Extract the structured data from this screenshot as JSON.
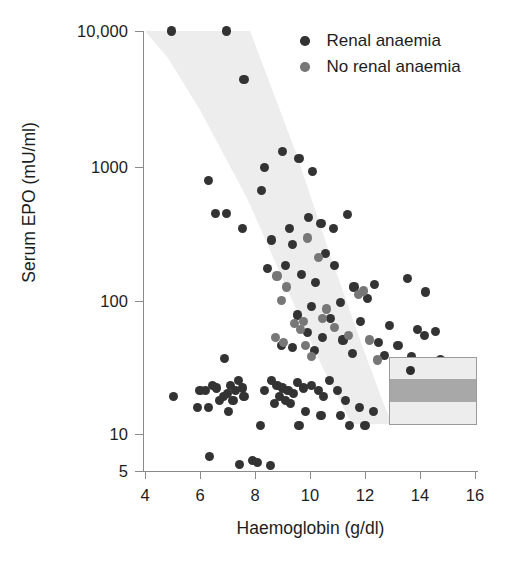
{
  "chart_data": {
    "type": "scatter",
    "title": "",
    "xlabel": "Haemoglobin (g/dl)",
    "ylabel": "Serum EPO (mU/ml)",
    "xlim": [
      4,
      16
    ],
    "ylim": [
      5,
      10000
    ],
    "yscale": "log",
    "xscale": "linear",
    "grid": false,
    "xticks": [
      4,
      6,
      8,
      10,
      12,
      14,
      16
    ],
    "xtick_labels": [
      "4",
      "6",
      "8",
      "10",
      "12",
      "14",
      "16"
    ],
    "yticks": [
      5,
      10,
      100,
      1000,
      10000
    ],
    "ytick_labels": [
      "5",
      "10",
      "100",
      "1000",
      "10,000"
    ],
    "legend_position": "top-right",
    "legend": [
      {
        "name": "Renal anaemia",
        "color": "#333333"
      },
      {
        "name": "No renal anaemia",
        "color": "#777777"
      }
    ],
    "annotations": [
      {
        "name": "reference-band",
        "description": "Shaded grey band showing normal EPO response to haemoglobin",
        "color": "#ededed"
      },
      {
        "name": "inset-box",
        "description": "Inset rectangle with grey reference band at lower right",
        "color": "#ededed",
        "band_color": "#a8a8a8"
      }
    ],
    "series": [
      {
        "name": "Renal anaemia",
        "color": "#333333",
        "points": [
          [
            4.95,
            10000
          ],
          [
            6.95,
            10000
          ],
          [
            7.6,
            4300
          ],
          [
            6.3,
            760
          ],
          [
            6.55,
            430
          ],
          [
            6.95,
            430
          ],
          [
            8.35,
            950
          ],
          [
            8.25,
            640
          ],
          [
            7.55,
            330
          ],
          [
            9.0,
            1250
          ],
          [
            9.6,
            1100
          ],
          [
            10.1,
            880
          ],
          [
            9.25,
            330
          ],
          [
            8.6,
            270
          ],
          [
            9.35,
            250
          ],
          [
            9.95,
            400
          ],
          [
            10.4,
            360
          ],
          [
            10.85,
            330
          ],
          [
            11.35,
            420
          ],
          [
            10.55,
            215
          ],
          [
            9.1,
            175
          ],
          [
            8.45,
            165
          ],
          [
            9.7,
            150
          ],
          [
            10.9,
            175
          ],
          [
            10.2,
            130
          ],
          [
            11.6,
            120
          ],
          [
            12.35,
            125
          ],
          [
            13.55,
            140
          ],
          [
            14.2,
            110
          ],
          [
            12.1,
            98
          ],
          [
            11.1,
            92
          ],
          [
            10.05,
            86
          ],
          [
            9.55,
            74
          ],
          [
            10.75,
            70
          ],
          [
            11.85,
            66
          ],
          [
            12.9,
            62
          ],
          [
            13.9,
            58
          ],
          [
            14.55,
            56
          ],
          [
            14.15,
            52
          ],
          [
            9.9,
            55
          ],
          [
            10.45,
            50
          ],
          [
            11.2,
            48
          ],
          [
            12.5,
            46
          ],
          [
            13.2,
            44
          ],
          [
            8.95,
            44
          ],
          [
            9.35,
            42
          ],
          [
            10.15,
            40
          ],
          [
            11.55,
            38
          ],
          [
            12.7,
            37
          ],
          [
            13.7,
            36
          ],
          [
            14.75,
            34
          ],
          [
            6.9,
            35
          ],
          [
            7.1,
            22
          ],
          [
            6.6,
            21
          ],
          [
            7.3,
            20
          ],
          [
            7.0,
            19
          ],
          [
            6.85,
            18
          ],
          [
            6.45,
            22
          ],
          [
            6.2,
            20
          ],
          [
            6.7,
            17
          ],
          [
            7.2,
            17
          ],
          [
            7.4,
            24
          ],
          [
            7.55,
            21
          ],
          [
            7.6,
            18
          ],
          [
            5.05,
            18
          ],
          [
            6.0,
            20
          ],
          [
            5.9,
            15
          ],
          [
            6.3,
            15
          ],
          [
            7.05,
            14
          ],
          [
            8.6,
            24
          ],
          [
            8.8,
            22
          ],
          [
            9.0,
            21
          ],
          [
            9.2,
            20
          ],
          [
            9.4,
            19
          ],
          [
            8.9,
            18
          ],
          [
            9.1,
            17
          ],
          [
            9.55,
            23
          ],
          [
            9.75,
            21
          ],
          [
            9.3,
            16
          ],
          [
            8.7,
            16
          ],
          [
            8.35,
            20
          ],
          [
            10.05,
            22
          ],
          [
            10.3,
            20
          ],
          [
            10.5,
            18
          ],
          [
            10.7,
            24
          ],
          [
            11.0,
            20
          ],
          [
            11.3,
            17
          ],
          [
            9.85,
            14
          ],
          [
            10.4,
            13
          ],
          [
            11.1,
            13
          ],
          [
            11.8,
            15
          ],
          [
            12.3,
            14
          ],
          [
            12.0,
            11
          ],
          [
            11.45,
            11
          ],
          [
            9.6,
            11
          ],
          [
            8.2,
            11
          ],
          [
            6.35,
            6.4
          ],
          [
            7.45,
            5.6
          ],
          [
            8.1,
            5.8
          ],
          [
            8.55,
            5.5
          ],
          [
            7.9,
            6.0
          ]
        ]
      },
      {
        "name": "No renal anaemia",
        "color": "#777777",
        "points": [
          [
            9.9,
            280
          ],
          [
            8.8,
            145
          ],
          [
            10.3,
            200
          ],
          [
            9.15,
            120
          ],
          [
            8.95,
            95
          ],
          [
            11.75,
            105
          ],
          [
            11.95,
            112
          ],
          [
            10.6,
            82
          ],
          [
            9.45,
            64
          ],
          [
            9.65,
            58
          ],
          [
            10.9,
            60
          ],
          [
            9.05,
            46
          ],
          [
            9.85,
            44
          ],
          [
            8.75,
            50
          ],
          [
            11.4,
            52
          ],
          [
            12.15,
            48
          ],
          [
            10.05,
            36
          ],
          [
            12.45,
            34
          ],
          [
            9.75,
            66
          ],
          [
            10.45,
            70
          ]
        ]
      }
    ]
  },
  "axes": {
    "y_title": "Serum EPO (mU/ml)",
    "x_title": "Haemoglobin (g/dl)",
    "y_ticks": [
      {
        "label": "10,000",
        "value": 10000
      },
      {
        "label": "1000",
        "value": 1000
      },
      {
        "label": "100",
        "value": 100
      },
      {
        "label": "10",
        "value": 10
      },
      {
        "label": "5",
        "value": 5
      }
    ],
    "x_ticks": [
      {
        "label": "4",
        "value": 4
      },
      {
        "label": "6",
        "value": 6
      },
      {
        "label": "8",
        "value": 8
      },
      {
        "label": "10",
        "value": 10
      },
      {
        "label": "12",
        "value": 12
      },
      {
        "label": "14",
        "value": 14
      },
      {
        "label": "16",
        "value": 16
      }
    ]
  },
  "legend": {
    "items": [
      {
        "label": "Renal anaemia",
        "color": "#333333"
      },
      {
        "label": "No renal anaemia",
        "color": "#777777"
      }
    ]
  },
  "colors": {
    "renal": "#333333",
    "no_renal": "#777777",
    "band": "#ededed",
    "inset_band": "#a8a8a8",
    "axis": "#8a8a8a",
    "text": "#1d1d1d"
  }
}
